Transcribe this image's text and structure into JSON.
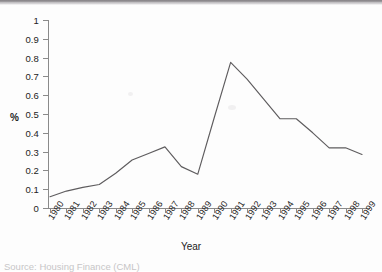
{
  "figure": {
    "source_note": "Source: Housing Finance (CML)"
  },
  "chart_data": {
    "type": "line",
    "title": "",
    "xlabel": "Year",
    "ylabel": "%",
    "grid": false,
    "legend": false,
    "ylim": [
      0,
      1
    ],
    "ytick_labels": [
      "1",
      "0.9",
      "0.8",
      "0.7",
      "0.6",
      "0.5",
      "0.4",
      "0.3",
      "0.2",
      "0.1",
      "0"
    ],
    "ytick_values": [
      1,
      0.9,
      0.8,
      0.7,
      0.6,
      0.5,
      0.4,
      0.3,
      0.2,
      0.1,
      0
    ],
    "categories": [
      "1980",
      "1981",
      "1982",
      "1983",
      "1984",
      "1985",
      "1986",
      "1987",
      "1988",
      "1989",
      "1990",
      "1991",
      "1992",
      "1993",
      "1994",
      "1995",
      "1996",
      "1997",
      "1998",
      "1999"
    ],
    "values": [
      0.06,
      0.09,
      0.11,
      0.125,
      0.185,
      0.255,
      0.29,
      0.325,
      0.22,
      0.18,
      0.48,
      0.775,
      0.685,
      0.58,
      0.475,
      0.475,
      0.4,
      0.32,
      0.32,
      0.285
    ],
    "series": [
      {
        "name": "",
        "values": [
          0.06,
          0.09,
          0.11,
          0.125,
          0.185,
          0.255,
          0.29,
          0.325,
          0.22,
          0.18,
          0.48,
          0.775,
          0.685,
          0.58,
          0.475,
          0.475,
          0.4,
          0.32,
          0.32,
          0.285
        ]
      }
    ],
    "line_color": "#5e5c5e"
  }
}
